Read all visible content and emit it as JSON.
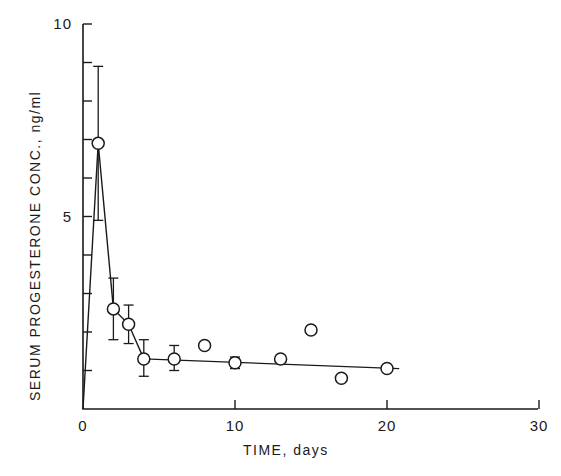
{
  "chart_data": {
    "type": "line",
    "title": "",
    "xlabel": "TIME, days",
    "ylabel": "SERUM PROGESTERONE CONC., ng/ml",
    "xlim": [
      0,
      30
    ],
    "ylim": [
      0,
      10
    ],
    "x_ticks": [
      0,
      10,
      20,
      30
    ],
    "x_tick_labels": [
      "0",
      "10",
      "20",
      "30"
    ],
    "y_ticks": [
      0,
      1,
      2,
      3,
      4,
      5,
      6,
      7,
      8,
      9,
      10
    ],
    "y_tick_labels": [
      "",
      "",
      "",
      "",
      "",
      "5",
      "",
      "",
      "",
      "",
      "10"
    ],
    "grid": false,
    "legend": null,
    "series": [
      {
        "name": "Serum progesterone (mean ± SE)",
        "marker": "open-circle",
        "points": [
          {
            "x": 1,
            "y": 6.9,
            "err_low": 4.9,
            "err_high": 8.9
          },
          {
            "x": 2,
            "y": 2.6,
            "err_low": 1.8,
            "err_high": 3.4
          },
          {
            "x": 3,
            "y": 2.2,
            "err_low": 1.7,
            "err_high": 2.7
          },
          {
            "x": 4,
            "y": 1.3,
            "err_low": 0.85,
            "err_high": 1.8
          },
          {
            "x": 6,
            "y": 1.3,
            "err_low": 1.0,
            "err_high": 1.65
          },
          {
            "x": 8,
            "y": 1.65
          },
          {
            "x": 10,
            "y": 1.2,
            "err_low": 1.05,
            "err_high": 1.35
          },
          {
            "x": 13,
            "y": 1.3
          },
          {
            "x": 15,
            "y": 2.05
          },
          {
            "x": 17,
            "y": 0.8
          },
          {
            "x": 20,
            "y": 1.05
          }
        ]
      }
    ],
    "connecting_line": [
      {
        "x": 0,
        "y": 0
      },
      {
        "x": 1,
        "y": 6.9
      },
      {
        "x": 2,
        "y": 2.6
      },
      {
        "x": 3,
        "y": 2.2
      },
      {
        "x": 4,
        "y": 1.3
      }
    ],
    "fit_line": [
      {
        "x": 4,
        "y": 1.3
      },
      {
        "x": 20.8,
        "y": 1.05
      }
    ]
  },
  "layout": {
    "x0_px": 83,
    "px_per_day": 15.2,
    "y0_px": 409,
    "px_per_unit": 38.5,
    "x_axis_end_px": 538,
    "y_axis_top_px": 24
  }
}
